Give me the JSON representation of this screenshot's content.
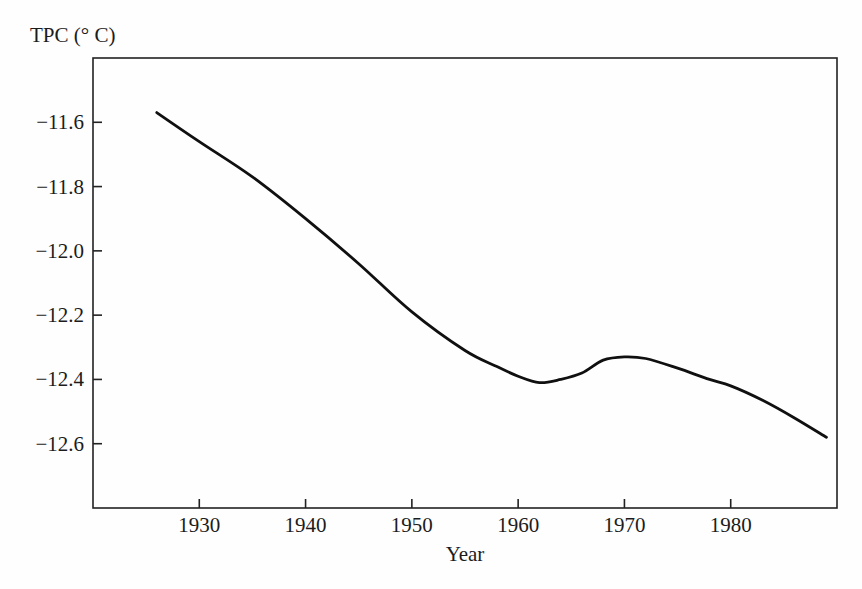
{
  "figure": {
    "background": "#fefefe",
    "ink_color": "#222222"
  },
  "chart_data": {
    "type": "line",
    "title": "",
    "ylabel": "TPC (° C)",
    "xlabel": "Year",
    "series": [
      {
        "name": "TPC",
        "x": [
          1926,
          1930,
          1935,
          1940,
          1945,
          1950,
          1955,
          1958,
          1960,
          1962,
          1964,
          1966,
          1968,
          1970,
          1972,
          1975,
          1978,
          1980,
          1983,
          1986,
          1989
        ],
        "values": [
          -11.57,
          -11.66,
          -11.77,
          -11.9,
          -12.04,
          -12.19,
          -12.31,
          -12.36,
          -12.39,
          -12.41,
          -12.4,
          -12.38,
          -12.34,
          -12.33,
          -12.335,
          -12.365,
          -12.4,
          -12.42,
          -12.465,
          -12.52,
          -12.58
        ],
        "color": "#101010",
        "line_width": 2.8
      }
    ],
    "xlim": [
      1920,
      1990
    ],
    "ylim": [
      -12.8,
      -11.4
    ],
    "x_ticks": [
      1930,
      1940,
      1950,
      1960,
      1970,
      1980
    ],
    "x_tick_labels": [
      "1930",
      "1940",
      "1950",
      "1960",
      "1970",
      "1980"
    ],
    "y_ticks": [
      -11.6,
      -11.8,
      -12.0,
      -12.2,
      -12.4,
      -12.6
    ],
    "y_tick_labels": [
      "−11.6",
      "−11.8",
      "−12.0",
      "−12.2",
      "−12.4",
      "−12.6"
    ],
    "grid": false,
    "legend": "none",
    "frame": "box",
    "tick_direction": "in"
  }
}
